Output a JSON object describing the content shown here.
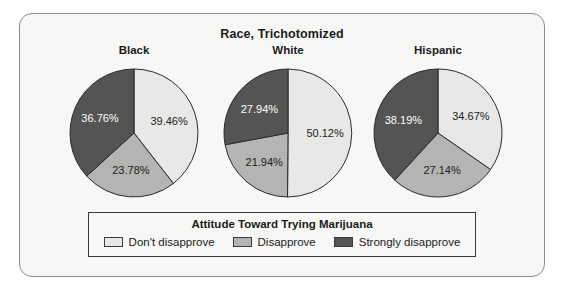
{
  "chart_data": {
    "type": "pie",
    "title": "Race, Trichotomized",
    "panels": [
      {
        "label": "Black",
        "categories": [
          "Don't disapprove",
          "Disapprove",
          "Strongly disapprove"
        ],
        "values": [
          39.46,
          23.78,
          36.76
        ],
        "value_labels": [
          "39.46%",
          "23.78%",
          "36.76%"
        ]
      },
      {
        "label": "White",
        "categories": [
          "Don't disapprove",
          "Disapprove",
          "Strongly disapprove"
        ],
        "values": [
          50.12,
          21.94,
          27.94
        ],
        "value_labels": [
          "50.12%",
          "21.94%",
          "27.94%"
        ]
      },
      {
        "label": "Hispanic",
        "categories": [
          "Don't disapprove",
          "Disapprove",
          "Strongly disapprove"
        ],
        "values": [
          34.67,
          27.14,
          38.19
        ],
        "value_labels": [
          "34.67%",
          "27.14%",
          "38.19%"
        ]
      }
    ],
    "legend": {
      "title": "Attitude Toward Trying Marijuana",
      "position": "bottom",
      "entries": [
        {
          "label": "Don't disapprove",
          "color": "#e8e8e6"
        },
        {
          "label": "Disapprove",
          "color": "#b4b4b2"
        },
        {
          "label": "Strongly disapprove",
          "color": "#545452"
        }
      ]
    },
    "colors": {
      "dont_disapprove": "#e8e8e6",
      "disapprove": "#b4b4b2",
      "strongly_disapprove": "#545452",
      "frame_border": "#8c8c8a",
      "panel_background": "#f7f7f5",
      "slice_outline": "#2b2b2b",
      "text": "#1b1b1b"
    },
    "start_angle_deg": 0,
    "direction": "clockwise",
    "xlabel": "",
    "ylabel": "",
    "grid": false
  }
}
